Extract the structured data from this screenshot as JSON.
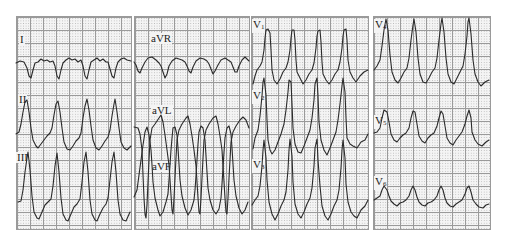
{
  "ecg": {
    "title": "",
    "colors": {
      "trace": "#2a2a2a",
      "grid_major": "#9a9a9a",
      "grid_minor": "#b8b8b8",
      "paper": "#f4f4f4"
    },
    "columns": [
      {
        "leads": [
          {
            "label": "I"
          },
          {
            "label": "II"
          },
          {
            "label": "III"
          }
        ]
      },
      {
        "leads": [
          {
            "label": "aVR"
          },
          {
            "label": "aVL"
          },
          {
            "label": "aVF"
          }
        ]
      },
      {
        "leads": [
          {
            "label": "V",
            "sub": "1"
          },
          {
            "label": "V",
            "sub": "2"
          },
          {
            "label": "V",
            "sub": "3"
          }
        ]
      },
      {
        "leads": [
          {
            "label": "V",
            "sub": "4"
          },
          {
            "label": "V",
            "sub": "5"
          },
          {
            "label": "V",
            "sub": "6"
          }
        ]
      }
    ],
    "beats_per_lead": 4,
    "rhythm": "wide-complex tachycardia"
  }
}
